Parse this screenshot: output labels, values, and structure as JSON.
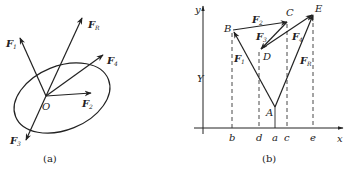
{
  "figure_a": {
    "caption": "(a)",
    "origin_label": "O",
    "forces": [
      {
        "id": "F1",
        "label": "F",
        "sub": "1"
      },
      {
        "id": "FR",
        "label": "F",
        "sub": "R"
      },
      {
        "id": "F4",
        "label": "F",
        "sub": "4"
      },
      {
        "id": "F2",
        "label": "F",
        "sub": "2"
      },
      {
        "id": "F3",
        "label": "F",
        "sub": "3"
      }
    ]
  },
  "figure_b": {
    "caption": "(b)",
    "axis_x_label": "x",
    "axis_y_label": "y",
    "y_annotation": "Y",
    "points": {
      "A": "A",
      "B": "B",
      "C": "C",
      "D": "D",
      "E": "E"
    },
    "x_ticks": [
      "b",
      "d",
      "a",
      "c",
      "e"
    ],
    "vectors": [
      {
        "id": "F1",
        "label": "F",
        "sub": "1",
        "from": "A",
        "to": "B"
      },
      {
        "id": "F2",
        "label": "F",
        "sub": "2",
        "from": "B",
        "to": "C"
      },
      {
        "id": "F3",
        "label": "F",
        "sub": "3",
        "from": "C",
        "to": "D"
      },
      {
        "id": "F4",
        "label": "F",
        "sub": "4",
        "from": "D",
        "to": "E"
      },
      {
        "id": "FR",
        "label": "F",
        "sub": "R",
        "from": "A",
        "to": "E"
      }
    ]
  }
}
